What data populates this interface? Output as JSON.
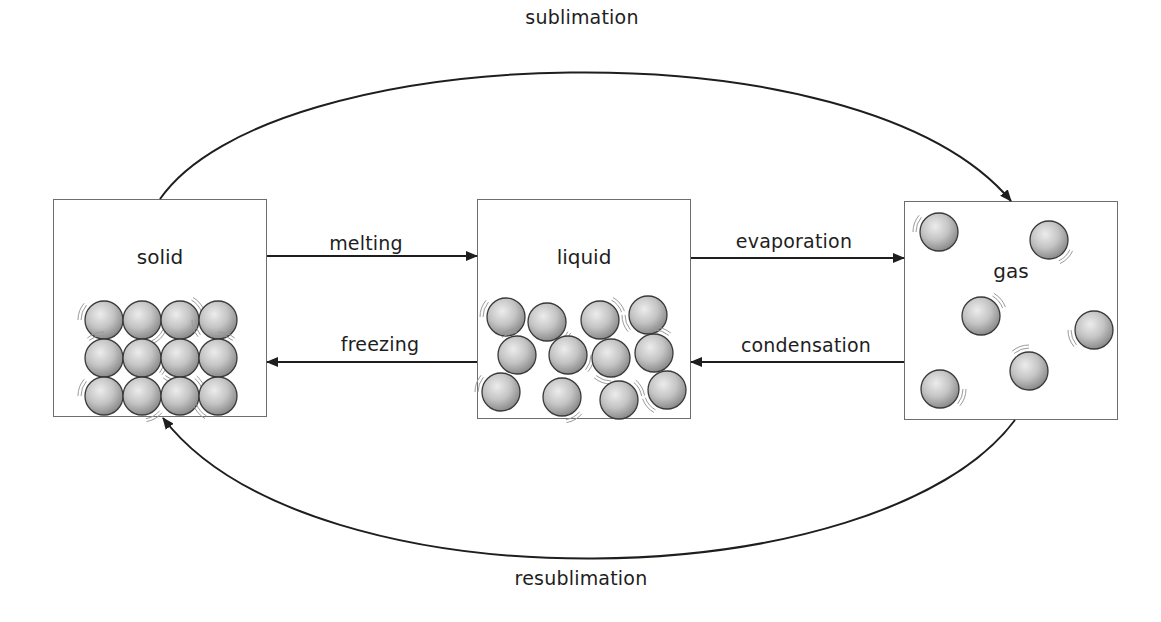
{
  "diagram": {
    "states": [
      {
        "id": "solid",
        "label": "solid",
        "box": {
          "x": 53,
          "y": 199,
          "w": 214,
          "h": 218
        },
        "label_y": 258,
        "particles": [
          [
            104,
            320
          ],
          [
            142,
            320
          ],
          [
            180,
            320
          ],
          [
            218,
            320
          ],
          [
            104,
            358
          ],
          [
            142,
            358
          ],
          [
            180,
            358
          ],
          [
            218,
            358
          ],
          [
            104,
            396
          ],
          [
            142,
            396
          ],
          [
            180,
            396
          ],
          [
            218,
            396
          ]
        ],
        "arrangement": "regular lattice, touching"
      },
      {
        "id": "liquid",
        "label": "liquid",
        "box": {
          "x": 477,
          "y": 199,
          "w": 214,
          "h": 220
        },
        "label_y": 258,
        "particles": [
          [
            506,
            317
          ],
          [
            547,
            322
          ],
          [
            600,
            320
          ],
          [
            648,
            315
          ],
          [
            517,
            355
          ],
          [
            568,
            355
          ],
          [
            611,
            358
          ],
          [
            654,
            353
          ],
          [
            501,
            392
          ],
          [
            562,
            397
          ],
          [
            619,
            400
          ],
          [
            667,
            390
          ]
        ],
        "arrangement": "close, disordered"
      },
      {
        "id": "gas",
        "label": "gas",
        "box": {
          "x": 904,
          "y": 201,
          "w": 214,
          "h": 219
        },
        "label_y": 272,
        "particles": [
          [
            939,
            232
          ],
          [
            1049,
            240
          ],
          [
            981,
            316
          ],
          [
            1094,
            330
          ],
          [
            1029,
            371
          ],
          [
            940,
            389
          ]
        ],
        "arrangement": "far apart, random"
      }
    ],
    "transitions": [
      {
        "id": "melting",
        "label": "melting",
        "from": "solid",
        "to": "liquid",
        "type": "straight",
        "y": 256,
        "x1": 267,
        "x2": 477,
        "label_pos": [
          366,
          243
        ]
      },
      {
        "id": "freezing",
        "label": "freezing",
        "from": "liquid",
        "to": "solid",
        "type": "straight",
        "y": 362,
        "x1": 477,
        "x2": 267,
        "label_pos": [
          380,
          344
        ]
      },
      {
        "id": "evaporation",
        "label": "evaporation",
        "from": "liquid",
        "to": "gas",
        "type": "straight",
        "y": 258,
        "x1": 691,
        "x2": 904,
        "label_pos": [
          794,
          241
        ]
      },
      {
        "id": "condensation",
        "label": "condensation",
        "from": "gas",
        "to": "liquid",
        "type": "straight",
        "y": 362,
        "x1": 904,
        "x2": 691,
        "label_pos": [
          806,
          345
        ]
      },
      {
        "id": "sublimation",
        "label": "sublimation",
        "from": "solid",
        "to": "gas",
        "type": "arc",
        "path": "M160,199 C270,40 860,20 1011,201",
        "label_pos": [
          582,
          17
        ]
      },
      {
        "id": "resublimation",
        "label": "resublimation",
        "from": "gas",
        "to": "solid",
        "type": "arc",
        "path": "M1015,420 C880,600 310,610 163,418",
        "label_pos": [
          581,
          578
        ]
      }
    ],
    "colors": {
      "stroke": "#1e1e1e",
      "box_border": "#6e6e6e",
      "particle_light": "#e6e6e6",
      "particle_dark": "#8c8c8c",
      "particle_outline": "#3a3a3a",
      "vibration": "#9a9a9a",
      "background": "#ffffff"
    }
  }
}
